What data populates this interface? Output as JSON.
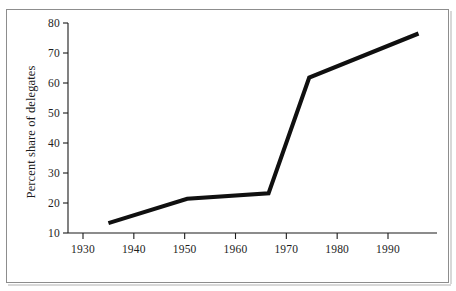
{
  "figure": {
    "background_color": "#ffffff",
    "frame_color": "#8d8d8d",
    "ink_color": "#101010"
  },
  "axes": {
    "y_title": "Percent share of delegates",
    "x_title": ""
  },
  "chart_data": {
    "type": "line",
    "title": "",
    "subtitle": "",
    "xlabel": "",
    "ylabel": "Percent share of delegates",
    "xlim": [
      1925,
      1997
    ],
    "ylim": [
      10,
      80
    ],
    "xticks": [
      1930,
      1940,
      1950,
      1960,
      1970,
      1980,
      1990
    ],
    "xtick_labels": [
      "1930",
      "1940",
      "1950",
      "1960",
      "1970",
      "1980",
      "1990"
    ],
    "yticks": [
      10,
      20,
      30,
      40,
      50,
      60,
      70,
      80
    ],
    "ytick_labels": [
      "10",
      "20",
      "30",
      "40",
      "50",
      "60",
      "70",
      "80"
    ],
    "grid": false,
    "legend": false,
    "legend_position": "none",
    "series": [
      {
        "name": "Percent share of delegates",
        "color": "#101010",
        "line_width": 4,
        "x": [
          1935,
          1950.5,
          1966.5,
          1974.5,
          1996
        ],
        "values": [
          13.3,
          21.4,
          23.2,
          61.8,
          76.5
        ]
      }
    ],
    "annotations": []
  }
}
